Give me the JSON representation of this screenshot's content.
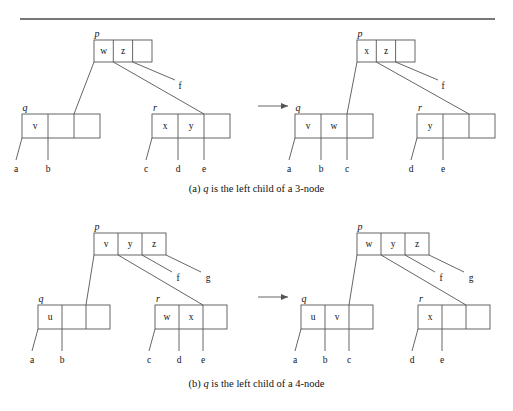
{
  "figure": {
    "rule": {
      "x1": 20,
      "x2": 495,
      "y": 19
    },
    "panels": [
      {
        "id": "panel-a",
        "caption_prefix": "(a)",
        "caption_var": "q",
        "caption_text": "is the left child of a 3-node",
        "caption_full": "(a) q is the left child of a 3-node",
        "before": {
          "parent": {
            "pointer": "p",
            "keys": [
              "w",
              "z",
              ""
            ]
          },
          "left": {
            "pointer": "q",
            "keys": [
              "v",
              "",
              ""
            ]
          },
          "right": {
            "pointer": "r",
            "keys": [
              "x",
              "y",
              ""
            ]
          },
          "left_leaves": [
            "a",
            "b"
          ],
          "right_leaves": [
            "c",
            "d",
            "e"
          ],
          "subtrees": [
            "f"
          ]
        },
        "after": {
          "parent": {
            "pointer": "p",
            "keys": [
              "x",
              "z",
              ""
            ]
          },
          "left": {
            "pointer": "q",
            "keys": [
              "v",
              "w",
              ""
            ]
          },
          "right": {
            "pointer": "r",
            "keys": [
              "y",
              "",
              ""
            ]
          },
          "left_leaves": [
            "a",
            "b",
            "c"
          ],
          "right_leaves": [
            "d",
            "e"
          ],
          "subtrees": [
            "f"
          ]
        }
      },
      {
        "id": "panel-b",
        "caption_prefix": "(b)",
        "caption_var": "q",
        "caption_text": "is the left child of a 4-node",
        "caption_full": "(b) q is the left child of a 4-node",
        "before": {
          "parent": {
            "pointer": "p",
            "keys": [
              "v",
              "y",
              "z"
            ]
          },
          "left": {
            "pointer": "q",
            "keys": [
              "u",
              "",
              ""
            ]
          },
          "right": {
            "pointer": "r",
            "keys": [
              "w",
              "x",
              ""
            ]
          },
          "left_leaves": [
            "a",
            "b"
          ],
          "right_leaves": [
            "c",
            "d",
            "e"
          ],
          "subtrees": [
            "f",
            "g"
          ]
        },
        "after": {
          "parent": {
            "pointer": "p",
            "keys": [
              "w",
              "y",
              "z"
            ]
          },
          "left": {
            "pointer": "q",
            "keys": [
              "u",
              "v",
              ""
            ]
          },
          "right": {
            "pointer": "r",
            "keys": [
              "x",
              "",
              ""
            ]
          },
          "left_leaves": [
            "a",
            "b",
            "c"
          ],
          "right_leaves": [
            "d",
            "e"
          ],
          "subtrees": [
            "f",
            "g"
          ]
        }
      }
    ],
    "arrow": {
      "label": "transforms-to"
    },
    "colors": {
      "stroke": "#555555",
      "rule": "#4a4a4a",
      "text": "#111111",
      "background": "#ffffff"
    }
  }
}
